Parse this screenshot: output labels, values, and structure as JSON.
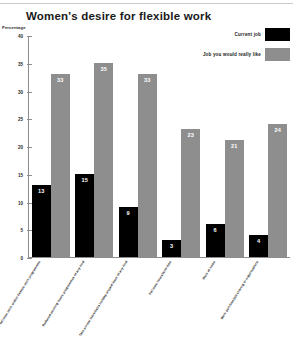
{
  "chart_data": {
    "type": "bar",
    "title": "Women's desire for flexible work",
    "ylabel": "Percentage",
    "xlabel": "",
    "ylim": [
      0,
      40
    ],
    "yticks": [
      0,
      5,
      10,
      15,
      20,
      25,
      30,
      35,
      40
    ],
    "grid": false,
    "legend_position": "top-right",
    "categories": [
      "Smooth hours for full-time work and/or flexible work programmes",
      "Reduced working hours programmes of any kind",
      "Take annual leave/extra holiday unpaid leave of any kind",
      "Full-time hours/term-time",
      "Work at home",
      "Work part-time/job sharing or organisations"
    ],
    "series": [
      {
        "name": "Current job",
        "color": "#000000",
        "values": [
          13,
          15,
          9,
          3,
          6,
          4
        ]
      },
      {
        "name": "Job you would really like",
        "color": "#8e8e8e",
        "values": [
          33,
          35,
          33,
          23,
          21,
          24
        ]
      }
    ]
  },
  "legend": {
    "items": [
      {
        "label": "Current job",
        "color": "#000000"
      },
      {
        "label": "Job you would really like",
        "color": "#8e8e8e"
      }
    ]
  }
}
